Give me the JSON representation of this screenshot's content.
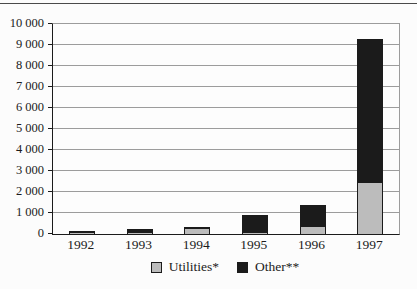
{
  "figure": {
    "background_color": "#fcfcfc",
    "top_rule_color": "#4a4a4a"
  },
  "chart_data": {
    "type": "bar",
    "stacked": true,
    "title": "",
    "xlabel": "",
    "ylabel": "",
    "categories": [
      "1992",
      "1993",
      "1994",
      "1995",
      "1996",
      "1997"
    ],
    "series": [
      {
        "name": "Utilities*",
        "color": "#bcbcbc",
        "values": [
          50,
          50,
          230,
          30,
          330,
          2450
        ]
      },
      {
        "name": "Other**",
        "color": "#1b1b1b",
        "values": [
          50,
          130,
          70,
          850,
          1020,
          6800
        ]
      }
    ],
    "totals": [
      100,
      180,
      300,
      880,
      1350,
      9250
    ],
    "ylim": [
      0,
      10000
    ],
    "ytick_interval": 1000,
    "ytick_labels": [
      "0",
      "1 000",
      "2 000",
      "3 000",
      "4 000",
      "5 000",
      "6 000",
      "7 000",
      "8 000",
      "9 000",
      "10 000"
    ],
    "grid": "horizontal",
    "gridline_color": "#9c9c9c",
    "axis_color": "#1b1b1b",
    "legend_position": "bottom-center"
  }
}
